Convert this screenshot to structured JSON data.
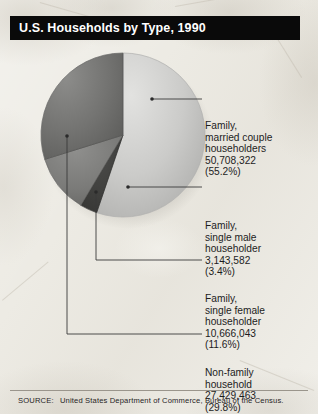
{
  "header": {
    "title": "U.S. Households by Type, 1990"
  },
  "footer": {
    "source_label": "SOURCE:",
    "source_text": "United States Department of Commerce, Bureau of the Census."
  },
  "colors": {
    "title_bar_bg": "#0a0a0a",
    "title_text": "#ffffff",
    "page_bg": "#edebe4",
    "slice_married": "#c6c6c6",
    "slice_nonfamily": "#6f6f6f",
    "slice_female": "#7c7c7c",
    "slice_male": "#3f3f3f",
    "leader_line": "#3a3a3a",
    "text": "#1d1d1d"
  },
  "chart_data": {
    "type": "pie",
    "title": "U.S. Households by Type, 1990",
    "source": "United States Department of Commerce, Bureau of the Census.",
    "legend_position": "callout-right",
    "grid": false,
    "total_label": "",
    "categories": [
      "Family, married couple householders",
      "Non-family household",
      "Family, single female householder",
      "Family, single male householder"
    ],
    "values": [
      50708322,
      27429463,
      10666043,
      3143582
    ],
    "percentages": [
      55.2,
      29.8,
      11.6,
      3.4
    ],
    "slices": [
      {
        "key": "married",
        "name_lines": [
          "Family,",
          "married couple",
          "householders"
        ],
        "value": 50708322,
        "value_text": "50,708,322",
        "percent": 55.2,
        "percent_text": "(55.2%)",
        "color": "#c6c6c6",
        "start_angle_deg": 0,
        "end_angle_deg": 198.7
      },
      {
        "key": "male",
        "name_lines": [
          "Family,",
          "single male",
          "householder"
        ],
        "value": 3143582,
        "value_text": "3,143,582",
        "percent": 3.4,
        "percent_text": "(3.4%)",
        "color": "#3f3f3f",
        "start_angle_deg": 198.7,
        "end_angle_deg": 211.0
      },
      {
        "key": "female",
        "name_lines": [
          "Family,",
          "single female",
          "householder"
        ],
        "value": 10666043,
        "value_text": "10,666,043",
        "percent": 11.6,
        "percent_text": "(11.6%)",
        "color": "#7c7c7c",
        "start_angle_deg": 211.0,
        "end_angle_deg": 252.7
      },
      {
        "key": "nonfamily",
        "name_lines": [
          "Non-family",
          "household"
        ],
        "value": 27429463,
        "value_text": "27,429,463",
        "percent": 29.8,
        "percent_text": "(29.8%)",
        "color": "#6f6f6f",
        "start_angle_deg": 252.7,
        "end_angle_deg": 360
      }
    ]
  },
  "labels": {
    "married": {
      "line1": "Family,",
      "line2": "married couple",
      "line3": "householders",
      "value": "50,708,322",
      "percent": "(55.2%)"
    },
    "male": {
      "line1": "Family,",
      "line2": "single male",
      "line3": "householder",
      "value": "3,143,582",
      "percent": "(3.4%)"
    },
    "female": {
      "line1": "Family,",
      "line2": "single female",
      "line3": "householder",
      "value": "10,666,043",
      "percent": "(11.6%)"
    },
    "nonfamily": {
      "line1": "Non-family",
      "line2": "household",
      "value": "27,429,463",
      "percent": "(29.8%)"
    }
  }
}
